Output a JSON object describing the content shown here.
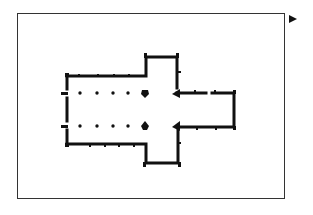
{
  "diagram": {
    "type": "floor-plan",
    "frame": {
      "x": 17,
      "y": 13,
      "width": 268,
      "height": 186,
      "stroke": "#333333"
    },
    "next_arrow": {
      "icon": "play-arrow-icon",
      "color": "#111111"
    },
    "colors": {
      "wall": "#111111",
      "background": "#ffffff"
    },
    "parts": [
      "nave",
      "north-transept",
      "south-transept",
      "chancel",
      "crossing",
      "nave-arcade-columns"
    ],
    "column_rows": [
      {
        "y": 93,
        "x": [
          80,
          97,
          113,
          128
        ]
      },
      {
        "y": 126,
        "x": [
          80,
          97,
          113,
          128
        ]
      }
    ],
    "crossing_piers": [
      {
        "x": 145,
        "y": 93
      },
      {
        "x": 145,
        "y": 126
      },
      {
        "x": 175,
        "y": 93
      },
      {
        "x": 175,
        "y": 126
      }
    ]
  }
}
